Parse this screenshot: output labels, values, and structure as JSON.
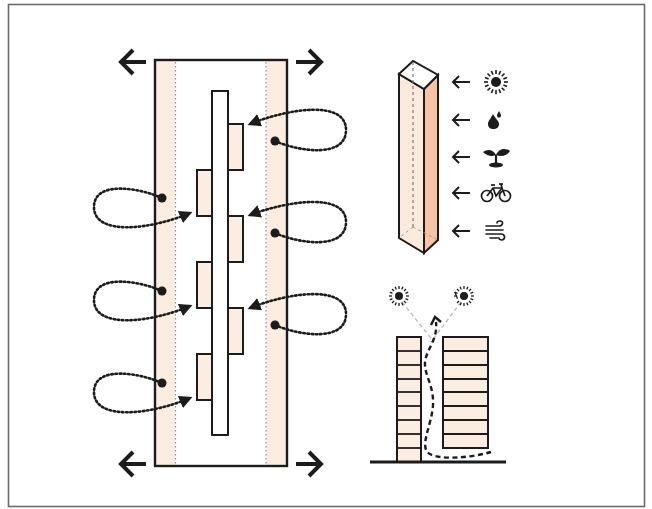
{
  "diagram": {
    "title": "",
    "colors": {
      "background": "#ffffff",
      "frame": "#6b6b6b",
      "stroke": "#1c1c1c",
      "fill_light": "#fbeee1",
      "fill_tower_front": "#fcebdc",
      "fill_tower_side": "#f6c3a4",
      "dashed_gray": "#b9b9b9"
    },
    "plan": {
      "label": "street-plan-with-staggered-building-blocks",
      "expansion_arrows": [
        "left-top",
        "right-top",
        "left-bottom",
        "right-bottom"
      ],
      "building_blocks": [
        {
          "side": "right",
          "order": 1
        },
        {
          "side": "left",
          "order": 2
        },
        {
          "side": "right",
          "order": 3
        },
        {
          "side": "left",
          "order": 4
        },
        {
          "side": "right",
          "order": 5
        },
        {
          "side": "left",
          "order": 6
        }
      ],
      "airflow_loops": [
        {
          "side": "right",
          "order": 1
        },
        {
          "side": "left",
          "order": 1
        },
        {
          "side": "right",
          "order": 2
        },
        {
          "side": "left",
          "order": 2
        },
        {
          "side": "right",
          "order": 3
        },
        {
          "side": "left",
          "order": 3
        }
      ]
    },
    "tower": {
      "label": "tower-receives-environmental-inputs",
      "inputs": [
        {
          "icon": "sun-icon",
          "glyph": "☀",
          "meaning": "sunlight"
        },
        {
          "icon": "water-drop-icon",
          "glyph": "💧",
          "meaning": "water"
        },
        {
          "icon": "sprout-icon",
          "glyph": "🌱",
          "meaning": "vegetation"
        },
        {
          "icon": "bicycle-icon",
          "glyph": "🚲",
          "meaning": "cycling"
        },
        {
          "icon": "wind-icon",
          "glyph": "🌬",
          "meaning": "wind"
        }
      ]
    },
    "section": {
      "label": "street-canyon-section",
      "left_building_floors": 9,
      "right_building_floors": 8,
      "suns": 2
    }
  }
}
